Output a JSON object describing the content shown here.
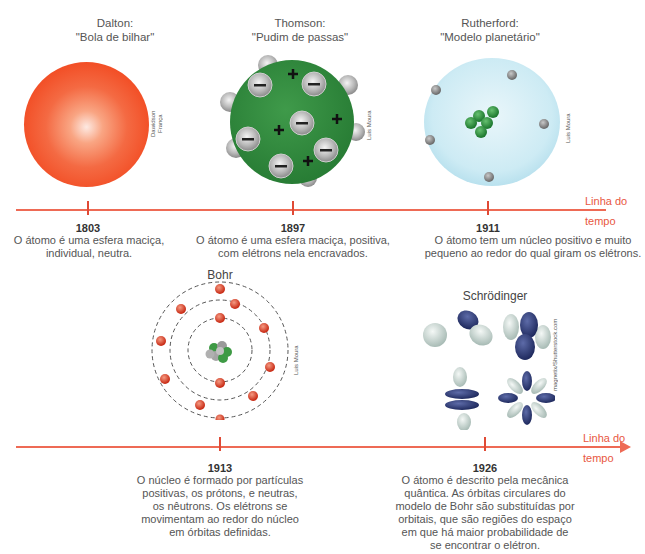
{
  "timeline_label": {
    "line1": "Linha do",
    "line2": "tempo"
  },
  "colors": {
    "timeline": "#ee6a55",
    "label": "#e8573f",
    "dalton": "#f2502a",
    "thomson": "#2f8a3c",
    "rutherford": "#cfeef7",
    "bohr_electron": "#d83a24",
    "schrodinger_dark": "#2f3d7a",
    "schrodinger_light": "#dde9e6"
  },
  "models": [
    {
      "name": "Dalton:",
      "nickname": "\"Bola de bilhar\"",
      "year": "1803",
      "desc_lines": [
        "O átomo é uma esfera maciça,",
        "individual, neutra."
      ],
      "credit_lines": [
        "Dawidson",
        "França"
      ]
    },
    {
      "name": "Thomson:",
      "nickname": "\"Pudim de passas\"",
      "year": "1897",
      "desc_lines": [
        "O átomo é uma esfera maciça, positiva,",
        "com elétrons nela encravados."
      ],
      "credit_lines": [
        "Luis Moura"
      ],
      "signs": {
        "minus": "−",
        "plus": "+"
      }
    },
    {
      "name": "Rutherford:",
      "nickname": "\"Modelo planetário\"",
      "year": "1911",
      "desc_lines": [
        "O átomo tem um núcleo positivo e muito",
        "pequeno ao redor do qual giram os elétrons."
      ],
      "credit_lines": [
        "Luis Moura"
      ]
    },
    {
      "name": "Bohr",
      "year": "1913",
      "desc_lines": [
        "O núcleo é formado por partículas",
        "positivas, os prótons, e neutras,",
        "os nêutrons. Os elétrons se",
        "movimentam ao redor do núcleo",
        "em órbitas definidas."
      ],
      "credit_lines": [
        "Luis Moura"
      ]
    },
    {
      "name": "Schrödinger",
      "year": "1926",
      "desc_lines": [
        "O átomo é descrito pela mecânica",
        "quântica. As órbitas circulares do",
        "modelo de Bohr são substituídas por",
        "orbitais, que são regiões do espaço",
        "em que há maior probabilidade de",
        "se encontrar o elétron."
      ],
      "credit_lines": [
        "magnetix/Shutterstock.com"
      ]
    }
  ]
}
